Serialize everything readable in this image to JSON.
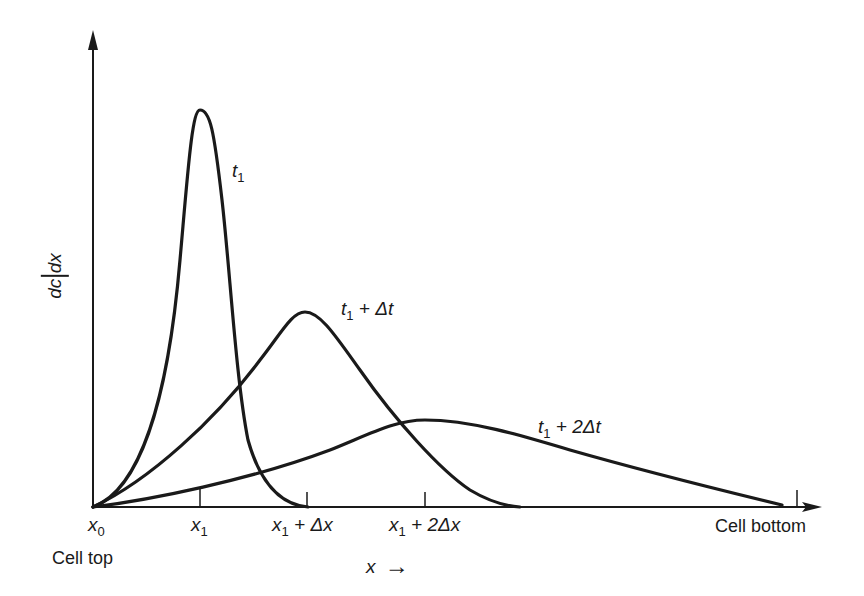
{
  "diagram": {
    "y_axis_label": {
      "numerator": "dc",
      "denominator": "dx"
    },
    "x_axis_label": "x",
    "x_axis_arrow": "→",
    "x_ticks": [
      {
        "name": "x",
        "sub": "0",
        "suffix": ""
      },
      {
        "name": "x",
        "sub": "1",
        "suffix": ""
      },
      {
        "name": "x",
        "sub": "1",
        "suffix": " + Δx"
      },
      {
        "name": "x",
        "sub": "1",
        "suffix": " + 2Δx"
      }
    ],
    "end_labels": {
      "left": "Cell top",
      "right": "Cell bottom"
    },
    "curves": [
      {
        "label_base": "t",
        "label_sub": "1",
        "label_suffix": "",
        "peak_position": "x1",
        "relative_peak_height": 1.0
      },
      {
        "label_base": "t",
        "label_sub": "1",
        "label_suffix": " + Δt",
        "peak_position": "x1 + Δx",
        "relative_peak_height": 0.49
      },
      {
        "label_base": "t",
        "label_sub": "1",
        "label_suffix": " + 2Δt",
        "peak_position": "x1 + 2Δx",
        "relative_peak_height": 0.22
      }
    ],
    "colors": {
      "ink": "#1a1a1a",
      "background": "#ffffff"
    }
  }
}
